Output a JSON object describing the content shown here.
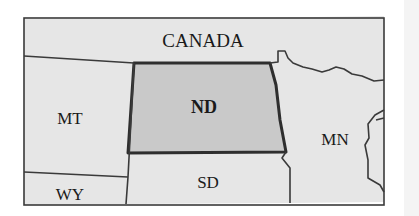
{
  "map": {
    "regions": [
      {
        "id": "canada",
        "label": "CANADA"
      },
      {
        "id": "mt",
        "label": "MT"
      },
      {
        "id": "nd",
        "label": "ND",
        "highlighted": true
      },
      {
        "id": "mn",
        "label": "MN"
      },
      {
        "id": "sd",
        "label": "SD"
      },
      {
        "id": "wy",
        "label": "WY"
      }
    ],
    "colors": {
      "background": "#e6e6e6",
      "highlight": "#c9c9c9",
      "border": "#3a3a3a",
      "highlight_border": "#2e2e2e"
    }
  }
}
